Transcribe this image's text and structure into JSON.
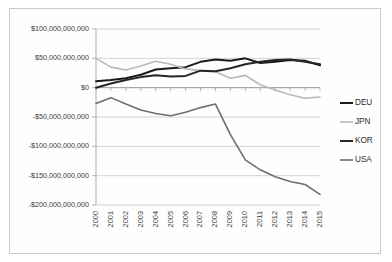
{
  "chart_data": {
    "type": "line",
    "title": "",
    "xlabel": "",
    "ylabel": "",
    "grid": true,
    "legend_position": "right",
    "categories": [
      "2000",
      "2001",
      "2002",
      "2003",
      "2004",
      "2005",
      "2006",
      "2007",
      "2008",
      "2009",
      "2010",
      "2011",
      "2012",
      "2013",
      "2014",
      "2015"
    ],
    "x": [
      2000,
      2001,
      2002,
      2003,
      2004,
      2005,
      2006,
      2007,
      2008,
      2009,
      2010,
      2011,
      2012,
      2013,
      2014,
      2015
    ],
    "ylim": [
      -200000000000,
      100000000000
    ],
    "ytick_values": [
      100000000000,
      50000000000,
      0,
      -50000000000,
      -100000000000,
      -150000000000,
      -200000000000
    ],
    "ytick_labels": [
      "$100,000,000,000",
      "$50,000,000,000",
      "$0",
      "-$50,000,000,000",
      "-$100,000,000,000",
      "-$150,000,000,000",
      "-$200,000,000,000"
    ],
    "series": [
      {
        "name": "DEU",
        "color": "#1a1a1a",
        "width": 2.0,
        "values": [
          11000000000,
          13000000000,
          16000000000,
          22000000000,
          31000000000,
          33000000000,
          35000000000,
          44000000000,
          48000000000,
          46000000000,
          50000000000,
          42000000000,
          44000000000,
          47000000000,
          46000000000,
          38000000000
        ]
      },
      {
        "name": "JPN",
        "color": "#b8b8b8",
        "width": 1.6,
        "values": [
          50000000000,
          35000000000,
          30000000000,
          37000000000,
          45000000000,
          40000000000,
          32000000000,
          29000000000,
          27000000000,
          16000000000,
          21000000000,
          5000000000,
          -4000000000,
          -12000000000,
          -18000000000,
          -16000000000
        ]
      },
      {
        "name": "KOR",
        "color": "#262626",
        "width": 2.0,
        "values": [
          0,
          7000000000,
          13000000000,
          18000000000,
          21000000000,
          19000000000,
          20000000000,
          29000000000,
          28000000000,
          33000000000,
          40000000000,
          44000000000,
          47000000000,
          48000000000,
          44000000000,
          40000000000
        ]
      },
      {
        "name": "USA",
        "color": "#6e6e6e",
        "width": 1.6,
        "values": [
          -27000000000,
          -17000000000,
          -28000000000,
          -38000000000,
          -44000000000,
          -48000000000,
          -42000000000,
          -34000000000,
          -28000000000,
          -80000000000,
          -123000000000,
          -140000000000,
          -152000000000,
          -160000000000,
          -165000000000,
          -182000000000
        ]
      }
    ]
  },
  "legend": {
    "items": [
      {
        "label": "DEU"
      },
      {
        "label": "JPN"
      },
      {
        "label": "KOR"
      },
      {
        "label": "USA"
      }
    ]
  }
}
